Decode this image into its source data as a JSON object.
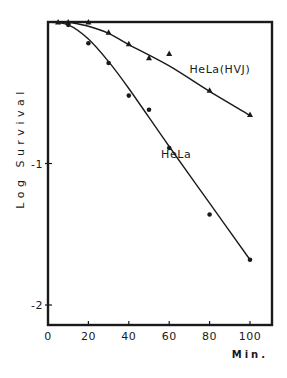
{
  "chart_data": {
    "type": "line",
    "title": "",
    "xlabel": "Min.",
    "ylabel": "Log Survival",
    "xlim": [
      0,
      110
    ],
    "ylim": [
      -2.14,
      0
    ],
    "xticks": [
      0,
      20,
      40,
      60,
      80,
      100
    ],
    "xtick_labels": [
      "0",
      "20",
      "40",
      "60",
      "80",
      "100"
    ],
    "yticks": [
      -1,
      -2
    ],
    "ytick_labels": [
      "-1",
      "-2"
    ],
    "grid": false,
    "legend": "inline labels",
    "colors": {
      "ink": "#1a1a1a",
      "background": "#ffffff"
    },
    "series": [
      {
        "name": "HeLa",
        "label": "HeLa",
        "marker": "circle",
        "points": [
          {
            "x": 10,
            "y": -0.02
          },
          {
            "x": 20,
            "y": -0.15
          },
          {
            "x": 30,
            "y": -0.29
          },
          {
            "x": 40,
            "y": -0.52
          },
          {
            "x": 50,
            "y": -0.62
          },
          {
            "x": 60,
            "y": -0.89
          },
          {
            "x": 80,
            "y": -1.36
          },
          {
            "x": 100,
            "y": -1.68
          }
        ],
        "fit": [
          {
            "x": 0,
            "y": 0
          },
          {
            "x": 10,
            "y": -0.02
          },
          {
            "x": 20,
            "y": -0.12
          },
          {
            "x": 30,
            "y": -0.28
          },
          {
            "x": 40,
            "y": -0.47
          },
          {
            "x": 60,
            "y": -0.88
          },
          {
            "x": 80,
            "y": -1.28
          },
          {
            "x": 100,
            "y": -1.68
          }
        ]
      },
      {
        "name": "HeLa(HVJ)",
        "label": "HeLa(HVJ)",
        "marker": "triangle",
        "points": [
          {
            "x": 5,
            "y": 0
          },
          {
            "x": 10,
            "y": 0
          },
          {
            "x": 20,
            "y": 0
          },
          {
            "x": 30,
            "y": -0.08
          },
          {
            "x": 40,
            "y": -0.16
          },
          {
            "x": 50,
            "y": -0.26
          },
          {
            "x": 60,
            "y": -0.23
          },
          {
            "x": 80,
            "y": -0.49
          },
          {
            "x": 100,
            "y": -0.66
          }
        ],
        "fit": [
          {
            "x": 10,
            "y": 0
          },
          {
            "x": 20,
            "y": -0.03
          },
          {
            "x": 30,
            "y": -0.08
          },
          {
            "x": 40,
            "y": -0.16
          },
          {
            "x": 60,
            "y": -0.31
          },
          {
            "x": 80,
            "y": -0.49
          },
          {
            "x": 100,
            "y": -0.66
          }
        ]
      }
    ],
    "annotations": [
      {
        "text": "HeLa(HVJ)",
        "x": 70,
        "y": -0.36
      },
      {
        "text": "HeLa",
        "x": 56,
        "y": -0.96
      }
    ]
  }
}
